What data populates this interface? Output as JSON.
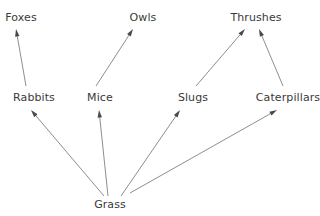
{
  "diagram": {
    "kind": "food-web",
    "background_color": "#ffffff",
    "edge_color": "#808080",
    "text_color": "#3a3a3a",
    "width": 320,
    "height": 216,
    "nodes": [
      {
        "id": "foxes",
        "label": "Foxes",
        "x": 21,
        "y": 17,
        "level": "secondary-consumer"
      },
      {
        "id": "owls",
        "label": "Owls",
        "x": 143,
        "y": 17,
        "level": "secondary-consumer"
      },
      {
        "id": "thrushes",
        "label": "Thrushes",
        "x": 256,
        "y": 17,
        "level": "secondary-consumer"
      },
      {
        "id": "rabbits",
        "label": "Rabbits",
        "x": 34,
        "y": 97,
        "level": "primary-consumer"
      },
      {
        "id": "mice",
        "label": "Mice",
        "x": 100,
        "y": 97,
        "level": "primary-consumer"
      },
      {
        "id": "slugs",
        "label": "Slugs",
        "x": 193,
        "y": 97,
        "level": "primary-consumer"
      },
      {
        "id": "caterpillars",
        "label": "Caterpillars",
        "x": 288,
        "y": 97,
        "level": "primary-consumer"
      },
      {
        "id": "grass",
        "label": "Grass",
        "x": 110,
        "y": 204,
        "level": "producer"
      }
    ],
    "edges": [
      {
        "id": "grass-rabbits",
        "from": "grass",
        "to": "rabbits",
        "x1": 104,
        "y1": 196,
        "x2": 31,
        "y2": 110
      },
      {
        "id": "grass-mice",
        "from": "grass",
        "to": "mice",
        "x1": 108,
        "y1": 196,
        "x2": 99,
        "y2": 110
      },
      {
        "id": "grass-slugs",
        "from": "grass",
        "to": "slugs",
        "x1": 121,
        "y1": 196,
        "x2": 180,
        "y2": 110
      },
      {
        "id": "grass-caterpillars",
        "from": "grass",
        "to": "caterpillars",
        "x1": 130,
        "y1": 193,
        "x2": 277,
        "y2": 110
      },
      {
        "id": "rabbits-foxes",
        "from": "rabbits",
        "to": "foxes",
        "x1": 26,
        "y1": 86,
        "x2": 16,
        "y2": 29
      },
      {
        "id": "mice-owls",
        "from": "mice",
        "to": "owls",
        "x1": 96,
        "y1": 86,
        "x2": 133,
        "y2": 29
      },
      {
        "id": "slugs-thrushes",
        "from": "slugs",
        "to": "thrushes",
        "x1": 196,
        "y1": 86,
        "x2": 245,
        "y2": 29
      },
      {
        "id": "caterpillars-thrushes",
        "from": "caterpillars",
        "to": "thrushes",
        "x1": 283,
        "y1": 86,
        "x2": 259,
        "y2": 29
      }
    ]
  }
}
